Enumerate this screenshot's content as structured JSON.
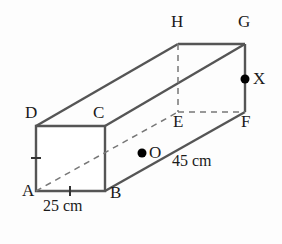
{
  "figure": {
    "background_color": "#fdfdfd",
    "edge_color": "#555555",
    "hidden_edge_color": "#777777",
    "text_color": "#1a1a1a"
  },
  "vertices": {
    "A": {
      "label": "A",
      "x": 36,
      "y": 191,
      "label_x": 22,
      "label_y": 192
    },
    "B": {
      "label": "B",
      "x": 105,
      "y": 191,
      "label_x": 110,
      "label_y": 194
    },
    "C": {
      "label": "C",
      "x": 105,
      "y": 126,
      "label_x": 93,
      "label_y": 114
    },
    "D": {
      "label": "D",
      "x": 36,
      "y": 126,
      "label_x": 25,
      "label_y": 114
    },
    "E": {
      "label": "E",
      "x": 178,
      "y": 112,
      "label_x": 173,
      "label_y": 122
    },
    "F": {
      "label": "F",
      "x": 245,
      "y": 112,
      "label_x": 241,
      "label_y": 122
    },
    "G": {
      "label": "G",
      "x": 245,
      "y": 44,
      "label_x": 238,
      "label_y": 22
    },
    "H": {
      "label": "H",
      "x": 178,
      "y": 44,
      "label_x": 171,
      "label_y": 22
    }
  },
  "marked_points": {
    "O": {
      "label": "O",
      "x": 142,
      "y": 153,
      "label_x": 149,
      "label_y": 146,
      "radius": 4.5
    },
    "X": {
      "label": "X",
      "x": 245,
      "y": 79,
      "label_x": 253,
      "label_y": 72,
      "radius": 4.5
    }
  },
  "measurements": {
    "width": {
      "text": "25 cm",
      "x": 43,
      "y": 205
    },
    "length": {
      "text": "45 cm",
      "x": 172,
      "y": 160
    }
  },
  "tick_marks": {
    "edge_AD": {
      "orientation": "horizontal",
      "x": 36,
      "y": 158,
      "size": 5
    },
    "edge_AB": {
      "orientation": "vertical",
      "x": 70,
      "y": 191,
      "size": 5
    }
  }
}
